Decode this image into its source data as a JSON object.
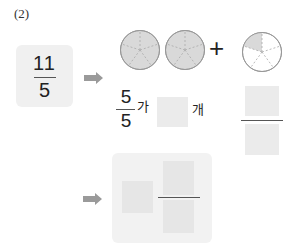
{
  "problem_label": "(2)",
  "given_fraction": {
    "numerator": "11",
    "denominator": "5"
  },
  "circles": [
    {
      "sectors": 5,
      "shaded": 5
    },
    {
      "sectors": 5,
      "shaded": 5
    },
    {
      "sectors": 5,
      "shaded": 1
    }
  ],
  "plus_sign": "+",
  "unit_fraction": {
    "numerator": "5",
    "denominator": "5"
  },
  "sentence": {
    "particle": "가",
    "counter": "개"
  },
  "colors": {
    "shade": "#d9d9d9",
    "box": "#f0f0f0",
    "arrow": "#9a9a9a"
  },
  "icons": {
    "arrow": "right-arrow-icon"
  }
}
